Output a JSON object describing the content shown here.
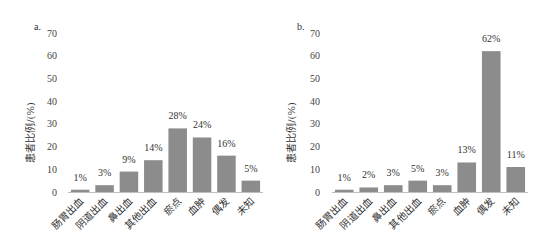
{
  "chart_data": [
    {
      "type": "bar",
      "panel_label": "a.",
      "title": "",
      "xlabel": "",
      "ylabel": "患者比例/(%)",
      "ylim": [
        0,
        70
      ],
      "yticks": [
        0,
        10,
        20,
        30,
        40,
        50,
        60,
        70
      ],
      "grid": false,
      "categories": [
        "肠胃出血",
        "阴道出血",
        "鼻出血",
        "其他出血",
        "瘀点",
        "血肿",
        "偶发",
        "未知"
      ],
      "values": [
        1,
        3,
        9,
        14,
        28,
        24,
        16,
        5
      ],
      "data_labels": [
        "1%",
        "3%",
        "9%",
        "14%",
        "28%",
        "24%",
        "16%",
        "5%"
      ],
      "bar_color": "#8c8c8c"
    },
    {
      "type": "bar",
      "panel_label": "b.",
      "title": "",
      "xlabel": "",
      "ylabel": "患者比例/(%)",
      "ylim": [
        0,
        70
      ],
      "yticks": [
        0,
        10,
        20,
        30,
        40,
        50,
        60,
        70
      ],
      "grid": false,
      "categories": [
        "肠胃出血",
        "阴道出血",
        "鼻出血",
        "其他出血",
        "瘀点",
        "血肿",
        "偶发",
        "未知"
      ],
      "values": [
        1,
        2,
        3,
        5,
        3,
        13,
        62,
        11
      ],
      "data_labels": [
        "1%",
        "2%",
        "3%",
        "5%",
        "3%",
        "13%",
        "62%",
        "11%"
      ],
      "bar_color": "#8c8c8c"
    }
  ]
}
